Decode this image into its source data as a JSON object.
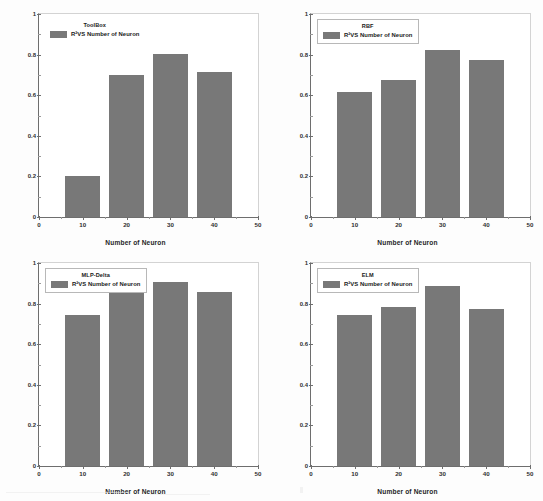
{
  "figure": {
    "panel_count": 4,
    "bar_color": "#787878",
    "axis_color": "#6e6e6e",
    "frame_color": "#d3d3d3",
    "background": "#ffffff"
  },
  "chart_data": [
    {
      "type": "bar",
      "title": "ToolBox",
      "legend": {
        "label": "R²VS Number of Neuron",
        "position": "top-left",
        "boxed": false
      },
      "categories": [
        "10",
        "20",
        "30",
        "40"
      ],
      "x": [
        10,
        20,
        30,
        40
      ],
      "values": [
        0.2,
        0.7,
        0.805,
        0.715
      ],
      "xlabel": "Number of Neuron",
      "ylabel": "Coefficient of determination",
      "xlim": [
        0,
        50
      ],
      "ylim": [
        0,
        1
      ],
      "xticks": [
        "0",
        "10",
        "20",
        "30",
        "40",
        "50"
      ],
      "yticks": [
        "0",
        "0.2",
        "0.4",
        "0.6",
        "0.8",
        "1"
      ],
      "grid": false
    },
    {
      "type": "bar",
      "title": "RBF",
      "legend": {
        "label": "R²VS Number of Neuron",
        "position": "top-left",
        "boxed": true
      },
      "categories": [
        "10",
        "20",
        "30",
        "40"
      ],
      "x": [
        10,
        20,
        30,
        40
      ],
      "values": [
        0.615,
        0.675,
        0.825,
        0.775
      ],
      "xlabel": "Number of Neuron",
      "ylabel": "Coefficient of determination",
      "xlim": [
        0,
        50
      ],
      "ylim": [
        0,
        1
      ],
      "xticks": [
        "0",
        "10",
        "20",
        "30",
        "40",
        "50"
      ],
      "yticks": [
        "0",
        "0.2",
        "0.4",
        "0.6",
        "0.8",
        "1"
      ],
      "grid": false
    },
    {
      "type": "bar",
      "title": "MLP-Delta",
      "legend": {
        "label": "R²VS Number of Neuron",
        "position": "top-left",
        "boxed": true
      },
      "categories": [
        "10",
        "20",
        "30",
        "40"
      ],
      "x": [
        10,
        20,
        30,
        40
      ],
      "values": [
        0.745,
        0.895,
        0.905,
        0.855
      ],
      "xlabel": "Number of Neuron",
      "ylabel": "Coefficient of determination",
      "xlim": [
        0,
        50
      ],
      "ylim": [
        0,
        1
      ],
      "xticks": [
        "0",
        "10",
        "20",
        "30",
        "40",
        "50"
      ],
      "yticks": [
        "0",
        "0.2",
        "0.4",
        "0.6",
        "0.8",
        "1"
      ],
      "grid": false
    },
    {
      "type": "bar",
      "title": "ELM",
      "legend": {
        "label": "R²VS Number of Neuron",
        "position": "top-left",
        "boxed": true
      },
      "categories": [
        "10",
        "20",
        "30",
        "40"
      ],
      "x": [
        10,
        20,
        30,
        40
      ],
      "values": [
        0.745,
        0.785,
        0.885,
        0.775
      ],
      "xlabel": "Number of Neuron",
      "ylabel": "Coefficient of determination",
      "xlim": [
        0,
        50
      ],
      "ylim": [
        0,
        1
      ],
      "xticks": [
        "0",
        "10",
        "20",
        "30",
        "40",
        "50"
      ],
      "yticks": [
        "0",
        "0.2",
        "0.4",
        "0.6",
        "0.8",
        "1"
      ],
      "grid": false
    }
  ]
}
